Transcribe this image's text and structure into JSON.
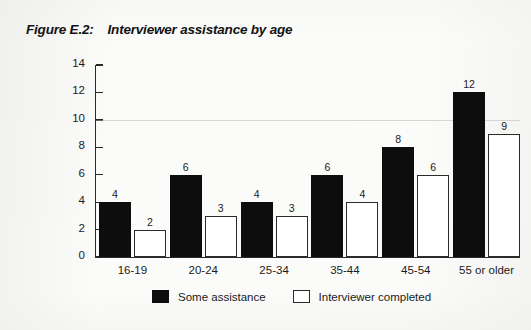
{
  "figure": {
    "label": "Figure E.2:",
    "title": "Interviewer assistance by age"
  },
  "legend": {
    "items": [
      {
        "name": "Some assistance",
        "swatch": "filled-black-square"
      },
      {
        "name": "Interviewer completed",
        "swatch": "outlined-white-square"
      }
    ]
  },
  "colors": {
    "series_dark": "#0d0d0d",
    "series_light": "#ffffff",
    "axis": "#2a2a2a",
    "text": "#1b1b1b",
    "page_background": "#fbfbfa"
  },
  "chart_data": {
    "type": "bar",
    "title": "Interviewer assistance by age",
    "xlabel": "",
    "ylabel": "Percentage",
    "categories": [
      "16-19",
      "20-24",
      "25-34",
      "35-44",
      "45-54",
      "55 or older"
    ],
    "series": [
      {
        "name": "Some assistance",
        "values": [
          4,
          6,
          4,
          6,
          8,
          12
        ]
      },
      {
        "name": "Interviewer completed",
        "values": [
          2,
          3,
          3,
          4,
          6,
          9
        ]
      }
    ],
    "ylim": [
      0,
      14
    ],
    "yticks": [
      0,
      2,
      4,
      6,
      8,
      10,
      12,
      14
    ],
    "ytick_labels": [
      "0",
      "2",
      "4",
      "6",
      "8",
      "10",
      "12",
      "14"
    ],
    "grid": "single faint horizontal line at y=10",
    "legend_position": "bottom-center",
    "data_labels": true
  }
}
